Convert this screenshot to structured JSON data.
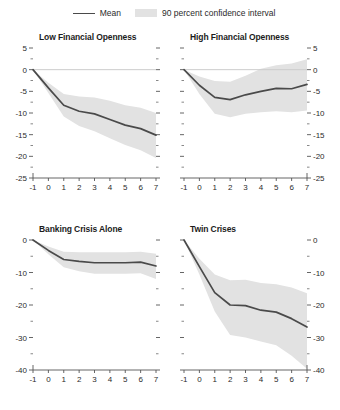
{
  "legend": {
    "items": [
      {
        "label": "Mean",
        "type": "line",
        "color": "#4a4a4a"
      },
      {
        "label": "90 percent confidence interval",
        "type": "band",
        "color": "#e2e2e2"
      }
    ]
  },
  "colors": {
    "mean_line": "#4a4a4a",
    "band": "#e2e2e2",
    "zero_line": "#cccccc",
    "axis": "#555555",
    "text": "#2b2b2b"
  },
  "chart_data": [
    {
      "type": "line",
      "panel": "top-left",
      "title": "Low Financial Openness",
      "xlabel": "",
      "ylabel": "",
      "xlim": [
        -1,
        7
      ],
      "ylim": [
        -25,
        5
      ],
      "xticks": [
        -1,
        0,
        1,
        2,
        3,
        4,
        5,
        6,
        7
      ],
      "xticklabels": [
        "-1",
        "0",
        "1",
        "2",
        "3",
        "4",
        "5",
        "6",
        "7"
      ],
      "yticks": [
        5,
        0,
        -5,
        -10,
        -15,
        -20,
        -25
      ],
      "yticklabels": [
        "5",
        "0",
        "-5",
        "-10",
        "-15",
        "-20",
        "-25"
      ],
      "yminorticks": [
        2.5,
        -2.5,
        -7.5,
        -12.5,
        -17.5,
        -22.5
      ],
      "ylabel_side": "left",
      "grid": false,
      "zero_line": true,
      "x": [
        -1,
        0,
        1,
        2,
        3,
        4,
        5,
        6,
        7
      ],
      "series": [
        {
          "name": "Mean",
          "values": [
            0,
            -4.2,
            -8.2,
            -9.6,
            -10.2,
            -11.5,
            -12.8,
            -13.6,
            -15.1
          ]
        }
      ],
      "band": {
        "name": "90 percent confidence interval",
        "lower": [
          0,
          -5.4,
          -10.8,
          -13.0,
          -14.2,
          -15.8,
          -17.4,
          -18.6,
          -20.4
        ],
        "upper": [
          0,
          -3.0,
          -5.6,
          -6.2,
          -6.4,
          -7.2,
          -8.2,
          -8.8,
          -10.0
        ]
      }
    },
    {
      "type": "line",
      "panel": "top-right",
      "title": "High Financial Openness",
      "xlabel": "",
      "ylabel": "",
      "xlim": [
        -1,
        7
      ],
      "ylim": [
        -25,
        5
      ],
      "xticks": [
        -1,
        0,
        1,
        2,
        3,
        4,
        5,
        6,
        7
      ],
      "xticklabels": [
        "-1",
        "0",
        "1",
        "2",
        "3",
        "4",
        "5",
        "6",
        "7"
      ],
      "yticks": [
        5,
        0,
        -5,
        -10,
        -15,
        -20,
        -25
      ],
      "yticklabels": [
        "5",
        "0",
        "-5",
        "-10",
        "-15",
        "-20",
        "-25"
      ],
      "yminorticks": [
        2.5,
        -2.5,
        -7.5,
        -12.5,
        -17.5,
        -22.5
      ],
      "ylabel_side": "right",
      "grid": false,
      "zero_line": true,
      "x": [
        -1,
        0,
        1,
        2,
        3,
        4,
        5,
        6,
        7
      ],
      "series": [
        {
          "name": "Mean",
          "values": [
            0,
            -3.6,
            -6.4,
            -6.9,
            -5.8,
            -5.0,
            -4.3,
            -4.4,
            -3.4
          ]
        }
      ],
      "band": {
        "name": "90 percent confidence interval",
        "lower": [
          0,
          -5.6,
          -10.2,
          -11.0,
          -10.2,
          -9.8,
          -9.6,
          -9.8,
          -9.4
        ],
        "upper": [
          0,
          -1.6,
          -2.6,
          -2.8,
          -1.4,
          0.2,
          1.0,
          1.4,
          2.4
        ]
      }
    },
    {
      "type": "line",
      "panel": "bottom-left",
      "title": "Banking Crisis Alone",
      "xlabel": "",
      "ylabel": "",
      "xlim": [
        -1,
        7
      ],
      "ylim": [
        -40,
        0
      ],
      "xticks": [
        -1,
        0,
        1,
        2,
        3,
        4,
        5,
        6,
        7
      ],
      "xticklabels": [
        "-1",
        "0",
        "1",
        "2",
        "3",
        "4",
        "5",
        "6",
        "7"
      ],
      "yticks": [
        0,
        -10,
        -20,
        -30,
        -40
      ],
      "yticklabels": [
        "0",
        "-10",
        "-20",
        "-30",
        "-40"
      ],
      "yminorticks": [
        -5,
        -15,
        -25,
        -35
      ],
      "ylabel_side": "left",
      "grid": false,
      "zero_line": false,
      "x": [
        -1,
        0,
        1,
        2,
        3,
        4,
        5,
        6,
        7
      ],
      "series": [
        {
          "name": "Mean",
          "values": [
            0,
            -3.2,
            -6.0,
            -6.6,
            -7.0,
            -7.0,
            -7.0,
            -6.8,
            -8.0
          ]
        }
      ],
      "band": {
        "name": "90 percent confidence interval",
        "lower": [
          0,
          -4.4,
          -8.4,
          -9.6,
          -10.4,
          -10.4,
          -10.4,
          -10.2,
          -12.0
        ],
        "upper": [
          0,
          -2.0,
          -3.6,
          -3.8,
          -3.8,
          -3.8,
          -3.8,
          -3.6,
          -4.2
        ]
      }
    },
    {
      "type": "line",
      "panel": "bottom-right",
      "title": "Twin Crises",
      "xlabel": "",
      "ylabel": "",
      "xlim": [
        -1,
        7
      ],
      "ylim": [
        -40,
        0
      ],
      "xticks": [
        -1,
        0,
        1,
        2,
        3,
        4,
        5,
        6,
        7
      ],
      "xticklabels": [
        "-1",
        "0",
        "1",
        "2",
        "3",
        "4",
        "5",
        "6",
        "7"
      ],
      "yticks": [
        0,
        -10,
        -20,
        -30,
        -40
      ],
      "yticklabels": [
        "0",
        "-10",
        "-20",
        "-30",
        "-40"
      ],
      "yminorticks": [
        -5,
        -15,
        -25,
        -35
      ],
      "ylabel_side": "right",
      "grid": false,
      "zero_line": false,
      "x": [
        -1,
        0,
        1,
        2,
        3,
        4,
        5,
        6,
        7
      ],
      "series": [
        {
          "name": "Mean",
          "values": [
            0,
            -8.2,
            -16.2,
            -20.0,
            -20.2,
            -21.6,
            -22.2,
            -24.2,
            -26.8
          ]
        }
      ],
      "band": {
        "name": "90 percent confidence interval",
        "lower": [
          0,
          -10.6,
          -22.0,
          -29.2,
          -30.0,
          -31.2,
          -32.4,
          -35.6,
          -39.6
        ],
        "upper": [
          0,
          -5.8,
          -10.6,
          -12.4,
          -12.2,
          -13.2,
          -13.6,
          -14.6,
          -16.4
        ]
      }
    }
  ]
}
